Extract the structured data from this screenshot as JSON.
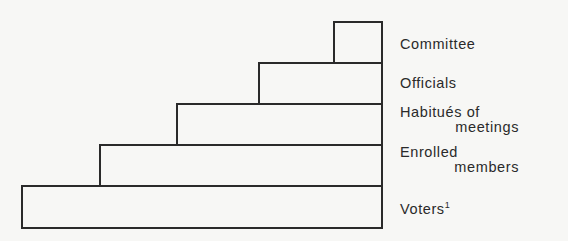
{
  "diagram": {
    "type": "stepped-pyramid",
    "levels": [
      {
        "id": "committee",
        "line1": "Committee",
        "line2": "",
        "left": 334,
        "top": 22,
        "bottom": 63
      },
      {
        "id": "officials",
        "line1": "Officials",
        "line2": "",
        "left": 259,
        "top": 63,
        "bottom": 104
      },
      {
        "id": "habitues",
        "line1": "Habitués of",
        "line2": "meetings",
        "left": 177,
        "top": 104,
        "bottom": 145
      },
      {
        "id": "enrolled",
        "line1": "Enrolled",
        "line2": "members",
        "left": 100,
        "top": 145,
        "bottom": 186
      },
      {
        "id": "voters",
        "line1": "Voters",
        "line2": "",
        "footnote": "1",
        "left": 22,
        "top": 186,
        "bottom": 228
      }
    ],
    "right_edge": 382,
    "line_color": "#2a2a2a"
  }
}
